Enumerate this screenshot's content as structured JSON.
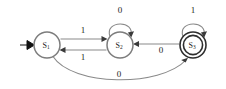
{
  "diagram": {
    "type": "finite-state-machine",
    "title": "",
    "background_color": "#ffffff",
    "edge_color": "#8a8a8a",
    "state_stroke_color": "#7d7d7d",
    "accept_stroke_color": "#2e2e2e",
    "label_color": "#1a1a1a",
    "start_marker_color": "#111111"
  },
  "states": [
    {
      "id": "S1",
      "base": "S",
      "subscript": "1",
      "label": "S1",
      "cx": 47,
      "cy": 45,
      "r": 13,
      "accepting": false,
      "start": true
    },
    {
      "id": "S2",
      "base": "S",
      "subscript": "2",
      "label": "S2",
      "cx": 120,
      "cy": 45,
      "r": 13,
      "accepting": false,
      "start": false
    },
    {
      "id": "S3",
      "base": "S",
      "subscript": "3",
      "label": "S3",
      "cx": 193,
      "cy": 45,
      "r": 13,
      "accepting": true,
      "start": false
    }
  ],
  "transitions": [
    {
      "id": "t1",
      "from": "S1",
      "to": "S2",
      "symbol": "1",
      "label_x": 83,
      "label_y": 32,
      "kind": "straight-upper"
    },
    {
      "id": "t2",
      "from": "S2",
      "to": "S1",
      "symbol": "1",
      "label_x": 83,
      "label_y": 57,
      "kind": "straight-lower"
    },
    {
      "id": "t3",
      "from": "S2",
      "to": "S2",
      "symbol": "0",
      "label_x": 120,
      "label_y": 11,
      "kind": "self-loop"
    },
    {
      "id": "t4",
      "from": "S3",
      "to": "S3",
      "symbol": "1",
      "label_x": 193,
      "label_y": 11,
      "kind": "self-loop"
    },
    {
      "id": "t5",
      "from": "S3",
      "to": "S2",
      "symbol": "0",
      "label_x": 161,
      "label_y": 50,
      "kind": "straight"
    },
    {
      "id": "t6",
      "from": "S1",
      "to": "S3",
      "symbol": "0",
      "label_x": 119,
      "label_y": 75,
      "kind": "bottom-curve"
    }
  ],
  "start_marker": {
    "name": "start-arrow",
    "x": 22,
    "y": 45
  }
}
